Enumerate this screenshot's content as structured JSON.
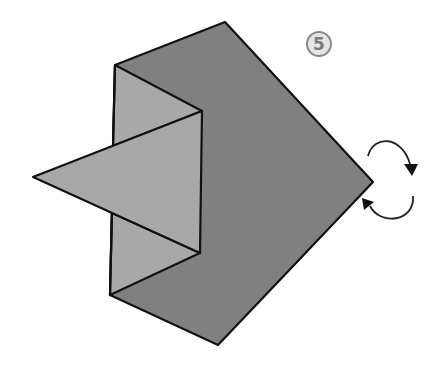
{
  "diagram": {
    "type": "origami-step",
    "step_number": "5",
    "colors": {
      "back_panel": "#808080",
      "front_panel": "#a8a8a8",
      "outline": "#111111",
      "step_circle_fill": "#e6e6e6",
      "step_circle_stroke": "#8a8a8a",
      "step_text": "#777777",
      "arrow": "#222222"
    },
    "shapes": {
      "pentagon_back": "115,65 225,22 373,182 218,345 110,295",
      "left_flap_upper": "115,65 202,111 113,146",
      "left_flap_lower": "112,213 200,253 110,295",
      "left_panel_middle": "113,146 202,111 200,253 112,213",
      "triangle_point": "33,177 202,111 200,253"
    },
    "arrows": {
      "turn_over_indicator": "rotate / turn model over",
      "upper_arc": "M367,155 C375,135 400,135 410,165",
      "lower_arc": "M413,196 C415,222 380,225 368,205"
    }
  }
}
